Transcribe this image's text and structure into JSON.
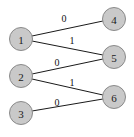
{
  "figure": {
    "name": "bipartite-graph",
    "width": 134,
    "height": 137,
    "background_color": "#ffffff"
  },
  "style": {
    "node_fill": "#c9c9c9",
    "node_stroke": "#8a8a8a",
    "edge_color": "#1a1a1a",
    "label_color": "#1a1a1a",
    "node_radius": 11.5
  },
  "chart_data": {
    "type": "diagram",
    "title": "",
    "nodes": [
      {
        "id": "1",
        "label": "1",
        "cx": 21,
        "cy": 39,
        "r": 11.5
      },
      {
        "id": "2",
        "label": "2",
        "cx": 21,
        "cy": 76,
        "r": 11.5
      },
      {
        "id": "3",
        "label": "3",
        "cx": 21,
        "cy": 113,
        "r": 11.5
      },
      {
        "id": "4",
        "label": "4",
        "cx": 114,
        "cy": 19,
        "r": 11.5
      },
      {
        "id": "5",
        "label": "5",
        "cx": 114,
        "cy": 57,
        "r": 11.5
      },
      {
        "id": "6",
        "label": "6",
        "cx": 114,
        "cy": 97,
        "r": 11.5
      }
    ],
    "edges": [
      {
        "from": "1",
        "to": "4",
        "label": "0",
        "x1": 32,
        "y1": 36,
        "x2": 103,
        "y2": 21,
        "lx": 64,
        "ly": 18
      },
      {
        "from": "1",
        "to": "5",
        "label": "1",
        "x1": 32,
        "y1": 41,
        "x2": 103,
        "y2": 55,
        "lx": 72,
        "ly": 40
      },
      {
        "from": "2",
        "to": "5",
        "label": "0",
        "x1": 32,
        "y1": 74,
        "x2": 103,
        "y2": 59,
        "lx": 57,
        "ly": 62
      },
      {
        "from": "2",
        "to": "6",
        "label": "1",
        "x1": 32,
        "y1": 79,
        "x2": 103,
        "y2": 95,
        "lx": 72,
        "ly": 82
      },
      {
        "from": "3",
        "to": "6",
        "label": "0",
        "x1": 32,
        "y1": 111,
        "x2": 103,
        "y2": 99,
        "lx": 57,
        "ly": 102
      }
    ]
  }
}
